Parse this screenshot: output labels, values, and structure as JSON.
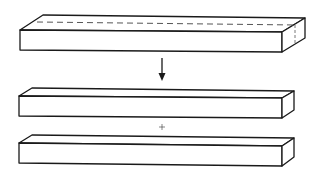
{
  "diagram": {
    "operator_arrow": "down-arrow",
    "operator_between_parts": "+",
    "colors": {
      "stroke": "#1a1a1a",
      "fill": "#ffffff",
      "dash": "#555555"
    },
    "blocks": [
      {
        "id": "original-block",
        "role": "whole",
        "has_cut_line": true
      },
      {
        "id": "upper-part",
        "role": "part"
      },
      {
        "id": "lower-part",
        "role": "part"
      }
    ]
  }
}
